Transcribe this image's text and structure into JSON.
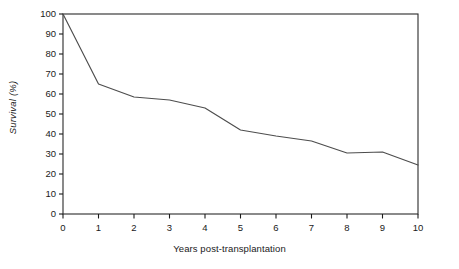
{
  "chart_data": {
    "type": "line",
    "title": "",
    "subtitle": "",
    "xlabel": "Years post-transplantation",
    "ylabel": "Survival (%)",
    "x": [
      0,
      1,
      2,
      3,
      4,
      5,
      6,
      7,
      8,
      9,
      10
    ],
    "series": [
      {
        "name": "Survival",
        "values": [
          100,
          65,
          58.5,
          57,
          53,
          42,
          39,
          36.5,
          30.5,
          31,
          24.5
        ]
      }
    ],
    "xlim": [
      0,
      10
    ],
    "ylim": [
      0,
      100
    ],
    "xticks": [
      "0",
      "1",
      "2",
      "3",
      "4",
      "5",
      "6",
      "7",
      "8",
      "9",
      "10"
    ],
    "yticks": [
      "0",
      "10",
      "20",
      "30",
      "40",
      "50",
      "60",
      "70",
      "80",
      "90",
      "100"
    ],
    "grid": false,
    "legend": "none",
    "line_color": "#4d4d4d",
    "axis_color": "#1a1a1a",
    "background_color": "#ffffff",
    "annotations": []
  }
}
